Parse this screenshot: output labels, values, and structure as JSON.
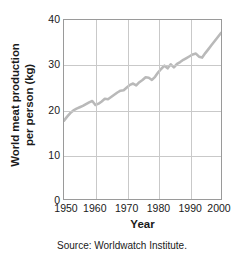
{
  "chart_data": {
    "type": "line",
    "title": "",
    "xlabel": "Year",
    "ylabel_line1": "World meat production",
    "ylabel_line2": "per person (kg)",
    "ylabel": "World meat production per person (kg)",
    "xlim": [
      1950,
      2000
    ],
    "ylim": [
      0,
      40
    ],
    "xticks": [
      1950,
      1960,
      1970,
      1980,
      1990,
      2000
    ],
    "xticklabels": [
      "1950",
      "1960",
      "1970",
      "1980",
      "1990",
      "2000"
    ],
    "yticks": [
      0,
      10,
      20,
      30,
      40
    ],
    "yticklabels": [
      "0",
      "10",
      "20",
      "30",
      "40"
    ],
    "grid": "both-interior",
    "legend": "none",
    "series_color": "#b9b9b9",
    "frame_color": "#9a9a9a",
    "grid_color": "#c9c9c9",
    "series": [
      {
        "name": "World meat production per person",
        "x": [
          1950,
          1951,
          1952,
          1953,
          1954,
          1955,
          1956,
          1957,
          1958,
          1959,
          1960,
          1961,
          1962,
          1963,
          1964,
          1965,
          1966,
          1967,
          1968,
          1969,
          1970,
          1971,
          1972,
          1973,
          1974,
          1975,
          1976,
          1977,
          1978,
          1979,
          1980,
          1981,
          1982,
          1983,
          1984,
          1985,
          1986,
          1987,
          1988,
          1989,
          1990,
          1991,
          1992,
          1993,
          1994,
          1995,
          1996,
          1997,
          1998,
          1999,
          2000
        ],
        "values": [
          17.5,
          18.4,
          19.2,
          19.8,
          20.2,
          20.5,
          20.8,
          21.2,
          21.6,
          21.9,
          21.0,
          21.3,
          21.8,
          22.4,
          22.3,
          22.8,
          23.3,
          23.8,
          24.2,
          24.3,
          24.9,
          25.5,
          25.8,
          25.4,
          26.1,
          26.6,
          27.2,
          27.1,
          26.6,
          27.3,
          28.3,
          29.1,
          29.8,
          29.2,
          30.1,
          29.4,
          30.2,
          30.6,
          31.1,
          31.5,
          31.9,
          32.3,
          32.5,
          31.8,
          31.6,
          32.6,
          33.5,
          34.4,
          35.3,
          36.2,
          37.1
        ]
      }
    ]
  },
  "caption": {
    "source": "Source: Worldwatch Institute."
  }
}
